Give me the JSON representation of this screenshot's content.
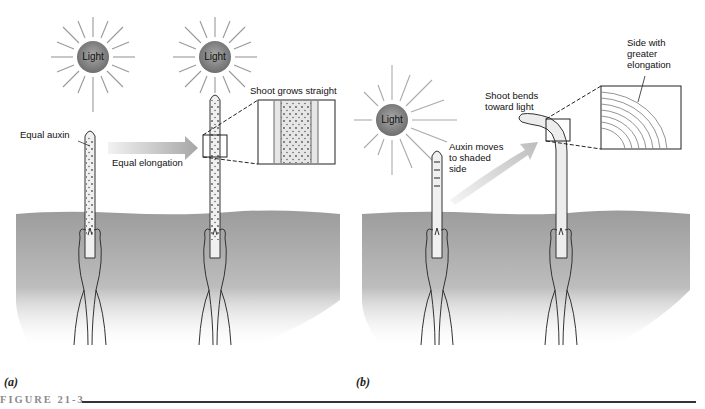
{
  "figure": {
    "number_label": "FIGURE 21-3",
    "panels": [
      {
        "id": "a",
        "label": "(a)",
        "sun_labels": [
          "Light",
          "Light"
        ],
        "annotations": {
          "equal_auxin": "Equal auxin",
          "equal_elongation": "Equal elongation",
          "shoot_grows_straight": "Shoot grows straight"
        }
      },
      {
        "id": "b",
        "label": "(b)",
        "sun_labels": [
          "Light"
        ],
        "annotations": {
          "auxin_moves": [
            "Auxin moves",
            "to shaded",
            "side"
          ],
          "shoot_bends": [
            "Shoot bends",
            "toward light"
          ],
          "side_greater": [
            "Side with",
            "greater",
            "elongation"
          ]
        }
      }
    ]
  },
  "colors": {
    "sun_core": "#8c8c8c",
    "soil": "#a9a9a9",
    "stem_fill": "#eeeeee",
    "outline": "#333333",
    "arrow": "#c8c8c8",
    "figure_label": "#8a8a8a"
  }
}
